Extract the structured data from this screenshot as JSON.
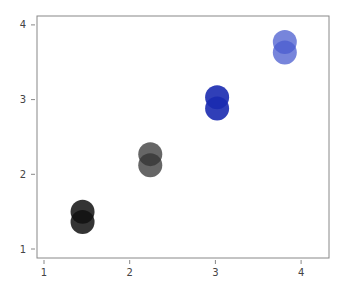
{
  "chart_data": {
    "type": "scatter",
    "title": "",
    "xlabel": "",
    "ylabel": "",
    "xlim": [
      0.92,
      4.33
    ],
    "ylim": [
      0.86,
      4.12
    ],
    "grid": false,
    "legend": null,
    "x_ticks": [
      1,
      2,
      3,
      4
    ],
    "y_ticks": [
      1,
      2,
      3,
      4
    ],
    "series": [
      {
        "name": "group-1",
        "color": "#111111",
        "opacity": 0.85,
        "points": [
          {
            "x": 1.45,
            "y": 1.5
          },
          {
            "x": 1.45,
            "y": 1.36
          }
        ]
      },
      {
        "name": "group-2",
        "color": "#333333",
        "opacity": 0.75,
        "points": [
          {
            "x": 2.24,
            "y": 2.27
          },
          {
            "x": 2.24,
            "y": 2.12
          }
        ]
      },
      {
        "name": "group-3",
        "color": "#1a2ab0",
        "opacity": 0.9,
        "points": [
          {
            "x": 3.02,
            "y": 3.03
          },
          {
            "x": 3.02,
            "y": 2.88
          }
        ]
      },
      {
        "name": "group-4",
        "color": "#4a5ccf",
        "opacity": 0.75,
        "points": [
          {
            "x": 3.81,
            "y": 3.77
          },
          {
            "x": 3.81,
            "y": 3.63
          }
        ]
      }
    ]
  }
}
